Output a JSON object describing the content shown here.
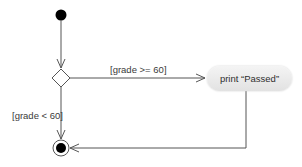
{
  "diagram": {
    "type": "UML activity diagram",
    "nodes": {
      "initial": {
        "kind": "initial-node"
      },
      "decision": {
        "kind": "decision-node"
      },
      "activity": {
        "kind": "action-state",
        "label": "print “Passed”"
      },
      "final": {
        "kind": "final-node"
      }
    },
    "edges": [
      {
        "from": "initial",
        "to": "decision",
        "guard": ""
      },
      {
        "from": "decision",
        "to": "activity",
        "guard": "[grade >= 60]"
      },
      {
        "from": "decision",
        "to": "final",
        "guard": "[grade < 60]"
      },
      {
        "from": "activity",
        "to": "final",
        "guard": ""
      }
    ],
    "guards": {
      "true_branch": "[grade >= 60]",
      "false_branch": "[grade < 60]"
    },
    "colors": {
      "line": "#555555",
      "node_fill": "#000000",
      "activity_fill": "#e8e8e8"
    }
  }
}
